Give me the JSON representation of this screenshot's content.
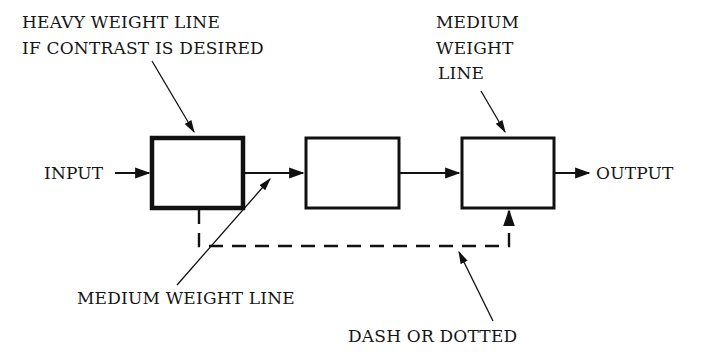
{
  "labels": {
    "heavy_line": [
      "HEAVY WEIGHT LINE",
      "IF CONTRAST IS DESIRED"
    ],
    "medium_top": [
      "MEDIUM",
      "WEIGHT",
      "LINE"
    ],
    "input": "INPUT",
    "output": "OUTPUT",
    "medium_bottom": "MEDIUM WEIGHT LINE",
    "dashed": "DASH OR DOTTED"
  },
  "boxes": [
    {
      "id": "block-1",
      "line_weight": "heavy"
    },
    {
      "id": "block-2",
      "line_weight": "medium"
    },
    {
      "id": "block-3",
      "line_weight": "medium"
    }
  ],
  "colors": {
    "ink": "#111111",
    "background": "#ffffff"
  }
}
